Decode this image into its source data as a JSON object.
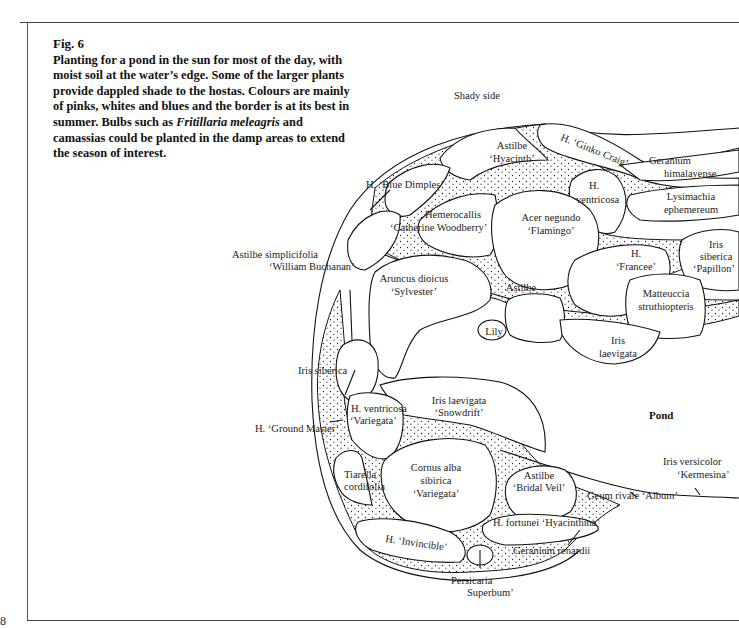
{
  "figure": {
    "title": "Fig. 6",
    "caption_part1": "Planting for a pond in the sun for most of the day, with moist soil at the water’s edge. Some of the larger plants provide dappled shade to the hostas. Colours are mainly of pinks, whites and blues and the border is at its best in summer. Bulbs such as ",
    "caption_italic": "Fritillaria meleagris",
    "caption_part2": " and camassias could be planted in the damp areas to extend the season of interest.",
    "page_number": "8"
  },
  "areas": {
    "shady_side": "Shady side",
    "pond": "Pond"
  },
  "plants": {
    "astilbe_hyacinth": [
      "Astilbe",
      "‘Hyacinth’"
    ],
    "h_ginko_craig": "H. ‘Ginko Craig’",
    "geranium_himalayense": [
      "Geranium",
      "himalayense"
    ],
    "h_blue_dimples": "H. ‘Blue Dimples’",
    "h_ventricosa": [
      "H.",
      "ventricosa"
    ],
    "lysimachia": [
      "Lysimachia",
      "ephemereum"
    ],
    "hemerocallis": [
      "Hemerocallis",
      "‘Catherine Woodberry’"
    ],
    "acer_negundo": [
      "Acer negundo",
      "‘Flamingo’"
    ],
    "astilbe_simplicifolia": [
      "Astilbe simplicifolia",
      "‘William Buchanan’"
    ],
    "h_francee": [
      "H.",
      "‘Francee’"
    ],
    "iris_siberica_papillon": [
      "Iris",
      "siberica",
      "‘Papillon’"
    ],
    "aruncus": [
      "Aruncus dioicus",
      "‘Sylvester’"
    ],
    "astilbe": "Astilbe",
    "matteuccia": [
      "Matteuccia",
      "struthiopteris"
    ],
    "lily": "Lily",
    "iris_laevigata": [
      "Iris",
      "laevigata"
    ],
    "iris_siberica": "Iris siberica",
    "iris_laevigata_snowdrift": [
      "Iris laevigata",
      "‘Snowdrift’"
    ],
    "h_ventricosa_variegata": [
      "H. ventricosa",
      "‘Variegata’"
    ],
    "h_ground_master": "H. ‘Ground Master’",
    "iris_versicolor": [
      "Iris versicolor",
      "‘Kermesina’"
    ],
    "tiarella": [
      "Tiarella",
      "cordifolia"
    ],
    "cornus": [
      "Cornus alba",
      "sibirica",
      "‘Variegata’"
    ],
    "astilbe_bridal_veil": [
      "Astilbe",
      "‘Bridal Veil’"
    ],
    "geum": "Geum rivale ‘Album’",
    "h_fortunei": "H. fortunei ‘Hyacinthina’",
    "h_invincible": "H. ‘Invincible’",
    "geranium_renardii": "Geranium renardii",
    "persicaria": [
      "Persicaria",
      "Superbum’"
    ]
  }
}
